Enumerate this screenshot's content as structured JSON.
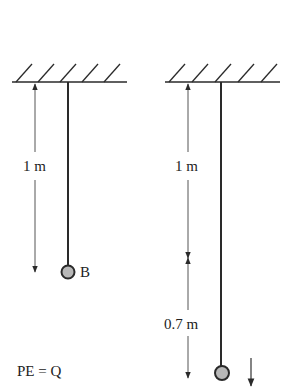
{
  "diagram": {
    "type": "physics-pendulum-comparison",
    "colors": {
      "line": "#2a2a2a",
      "arrow": "#333333",
      "bob_fill": "#b8b8b8",
      "bob_stroke": "#2a2a2a",
      "text": "#222222"
    },
    "left": {
      "length_label": "1 m",
      "bob_label": "B",
      "energy_label": "PE = Q"
    },
    "right": {
      "length_label": "1 m",
      "extension_label": "0.7 m",
      "motion_arrow": "down-arrow"
    }
  }
}
